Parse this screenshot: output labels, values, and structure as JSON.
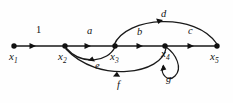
{
  "figure": {
    "type": "directed-graph-diagram",
    "background_color": "#fefefe",
    "stroke_color": "#1a1a1a",
    "width": 233,
    "height": 103
  },
  "nodes": [
    {
      "id": "x1",
      "label": "x",
      "sub": "1",
      "x": 14,
      "y": 46,
      "label_x": 9,
      "label_y": 55
    },
    {
      "id": "x2",
      "label": "x",
      "sub": "2",
      "x": 65,
      "y": 46,
      "label_x": 58,
      "label_y": 55
    },
    {
      "id": "x3",
      "label": "x",
      "sub": "3",
      "x": 115,
      "y": 46,
      "label_x": 110,
      "label_y": 55
    },
    {
      "id": "x4",
      "label": "x",
      "sub": "4",
      "x": 165,
      "y": 46,
      "label_x": 161,
      "label_y": 52
    },
    {
      "id": "x5",
      "label": "x",
      "sub": "5",
      "x": 217,
      "y": 46,
      "label_x": 210,
      "label_y": 55
    }
  ],
  "edges": [
    {
      "id": "e1",
      "label": "1",
      "from": "x1",
      "to": "x2",
      "shape": "straight",
      "label_x": 36,
      "label_y": 25,
      "italic": false
    },
    {
      "id": "ea",
      "label": "a",
      "from": "x2",
      "to": "x3",
      "shape": "straight",
      "label_x": 87,
      "label_y": 26,
      "italic": true
    },
    {
      "id": "eb",
      "label": "b",
      "from": "x3",
      "to": "x4",
      "shape": "straight",
      "label_x": 137,
      "label_y": 27,
      "italic": true
    },
    {
      "id": "ec",
      "label": "c",
      "from": "x4",
      "to": "x5",
      "shape": "straight",
      "label_x": 188,
      "label_y": 26,
      "italic": true
    },
    {
      "id": "ed",
      "label": "d",
      "from": "x3",
      "to": "x5",
      "shape": "arc-above",
      "label_x": 161,
      "label_y": 9,
      "italic": true
    },
    {
      "id": "ee",
      "label": "e",
      "from": "x3",
      "to": "x2",
      "shape": "arc-below-shallow",
      "label_x": 95,
      "label_y": 61,
      "italic": true
    },
    {
      "id": "ef",
      "label": "f",
      "from": "x4",
      "to": "x2",
      "shape": "arc-below-deep",
      "label_x": 117,
      "label_y": 80,
      "italic": true
    },
    {
      "id": "eg",
      "label": "g",
      "from": "x4",
      "to": "x4",
      "shape": "self-loop",
      "label_x": 166,
      "label_y": 74,
      "italic": true
    }
  ]
}
